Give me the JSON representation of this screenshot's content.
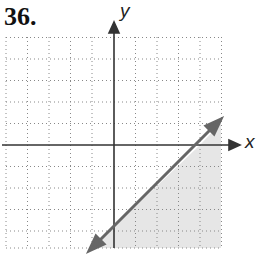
{
  "problem_number": "36.",
  "axes": {
    "x_label": "x",
    "y_label": "y"
  },
  "graph": {
    "x_range": [
      -5,
      5
    ],
    "y_range": [
      -5,
      5
    ],
    "boundary_line": {
      "slope": 1,
      "intercept": -4,
      "style": "solid"
    },
    "shaded_region": "below-right of line",
    "colors": {
      "line": "#666666",
      "shade": "#e6e6e6",
      "axis": "#333333",
      "grid": "#888888"
    }
  }
}
